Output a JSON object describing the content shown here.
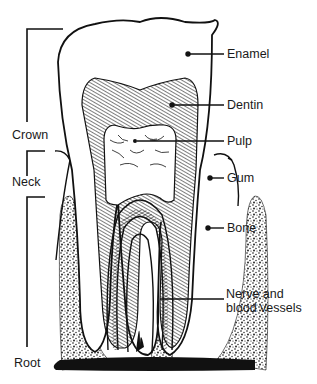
{
  "figure": {
    "colors": {
      "ink": "#111111",
      "background": "#ffffff"
    }
  },
  "left_labels": {
    "crown": "Crown",
    "neck": "Neck",
    "root": "Root"
  },
  "right_labels": {
    "enamel": "Enamel",
    "dentin": "Dentin",
    "pulp": "Pulp",
    "gum": "Gum",
    "bone": "Bone",
    "nerve": "Nerve and\nblood vessels"
  }
}
